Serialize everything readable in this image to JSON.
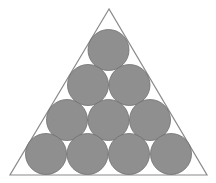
{
  "diagram": {
    "colors": {
      "background": "#ffffff",
      "triangle_stroke": "#8a8a8a",
      "circle_fill": "#8f8f8f",
      "circle_stroke": "#6e6e6e"
    },
    "triangle": {
      "points": [
        [
          109,
          9
        ],
        [
          10,
          175
        ],
        [
          207,
          175
        ]
      ]
    },
    "circle_radius": 20.5,
    "rows": [
      {
        "count": 1,
        "centers": [
          [
            108.5,
            50
          ]
        ]
      },
      {
        "count": 2,
        "centers": [
          [
            88,
            85
          ],
          [
            129.5,
            85
          ]
        ]
      },
      {
        "count": 3,
        "centers": [
          [
            67,
            120
          ],
          [
            108.5,
            120
          ],
          [
            150,
            120
          ]
        ]
      },
      {
        "count": 4,
        "centers": [
          [
            46,
            154
          ],
          [
            87.5,
            154
          ],
          [
            129,
            154
          ],
          [
            171,
            154
          ]
        ]
      }
    ],
    "total_circles": 10
  }
}
